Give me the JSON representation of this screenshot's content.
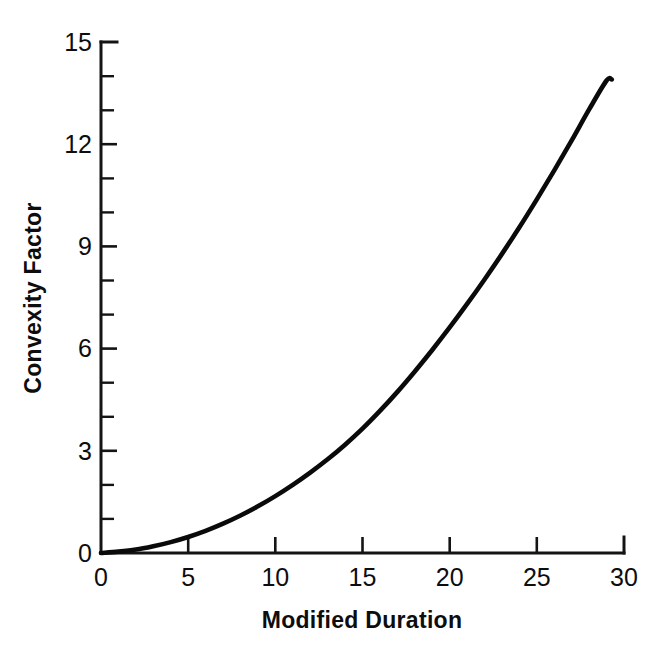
{
  "chart_data": {
    "type": "line",
    "title": "",
    "subtitle": "",
    "xlabel": "Modified Duration",
    "ylabel": "Convexity Factor",
    "xlim": [
      0,
      30
    ],
    "ylim": [
      0,
      15
    ],
    "x_ticks": [
      0,
      5,
      10,
      15,
      20,
      25,
      30
    ],
    "x_tick_labels": [
      "0",
      "5",
      "10",
      "15",
      "20",
      "25",
      "30"
    ],
    "x_minor_tick_interval": 5,
    "y_ticks": [
      0,
      3,
      6,
      9,
      12,
      15
    ],
    "y_tick_labels": [
      "0",
      "3",
      "6",
      "9",
      "12",
      "15"
    ],
    "y_minor_tick_interval": 1,
    "grid": false,
    "legend": null,
    "legend_position": "none",
    "series": [
      {
        "name": "Convexity Factor",
        "color": "#0a0a0a",
        "x": [
          0,
          1,
          2,
          3,
          4,
          5,
          6,
          7,
          8,
          9,
          10,
          11,
          12,
          13,
          14,
          15,
          16,
          17,
          18,
          19,
          20,
          21,
          22,
          23,
          24,
          25,
          26,
          27,
          28,
          29,
          29.3
        ],
        "values": [
          0,
          0.04,
          0.1,
          0.2,
          0.32,
          0.47,
          0.65,
          0.86,
          1.1,
          1.37,
          1.67,
          2.0,
          2.36,
          2.75,
          3.18,
          3.65,
          4.17,
          4.73,
          5.33,
          5.96,
          6.62,
          7.31,
          8.03,
          8.78,
          9.56,
          10.38,
          11.23,
          12.11,
          13.02,
          13.87,
          13.9
        ]
      }
    ],
    "annotations": []
  },
  "axes": {
    "y_title": "Convexity Factor",
    "x_title": "Modified Duration"
  }
}
